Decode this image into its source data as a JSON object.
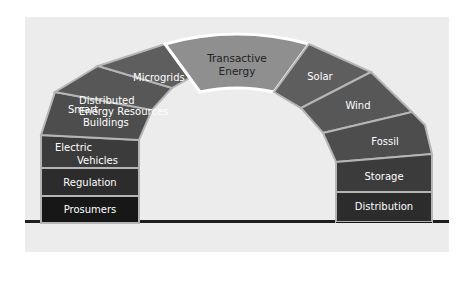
{
  "diagram": {
    "colors": {
      "background_panel": "#ececec",
      "keystone_fill": "#8f8f8f",
      "keystone_border": "#ffffff",
      "stone_separator": "#b5b5b5",
      "ground_line": "#1e1e1e"
    },
    "keystone": {
      "line1": "Transactive",
      "line2": "Energy"
    },
    "left_leg": [
      {
        "id": "microgrids",
        "lines": [
          "Microgrids"
        ],
        "fill": "#5e5e5e"
      },
      {
        "id": "distributed-energy-resources",
        "lines": [
          "Distributed",
          "Energy Resources"
        ],
        "fill": "#575757"
      },
      {
        "id": "smart-buildings",
        "lines": [
          "Smart",
          "Buildings"
        ],
        "fill": "#4d4d4d"
      },
      {
        "id": "electric-vehicles",
        "lines": [
          "Electric",
          "Vehicles"
        ],
        "fill": "#3b3b3b"
      },
      {
        "id": "regulation",
        "lines": [
          "Regulation"
        ],
        "fill": "#2c2c2c"
      },
      {
        "id": "prosumers",
        "lines": [
          "Prosumers"
        ],
        "fill": "#171717"
      }
    ],
    "right_leg": [
      {
        "id": "solar",
        "lines": [
          "Solar"
        ],
        "fill": "#5e5e5e"
      },
      {
        "id": "wind",
        "lines": [
          "Wind"
        ],
        "fill": "#575757"
      },
      {
        "id": "fossil",
        "lines": [
          "Fossil"
        ],
        "fill": "#4d4d4d"
      },
      {
        "id": "storage",
        "lines": [
          "Storage"
        ],
        "fill": "#3b3b3b"
      },
      {
        "id": "distribution",
        "lines": [
          "Distribution"
        ],
        "fill": "#2c2c2c"
      },
      {
        "id": "transmission",
        "lines": [
          "Transmission"
        ],
        "fill": "#171717"
      }
    ]
  }
}
